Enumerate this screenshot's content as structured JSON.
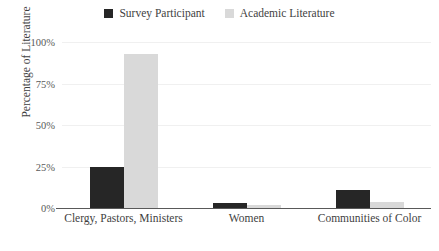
{
  "chart_data": {
    "type": "bar",
    "title": "",
    "subtitle": "",
    "xlabel": "",
    "ylabel": "Percentage of Literature",
    "ylim": [
      0,
      100
    ],
    "ytick_labels": [
      "0%",
      "25%",
      "50%",
      "75%",
      "100%"
    ],
    "ytick_values": [
      0,
      25,
      50,
      75,
      100
    ],
    "grid": "horizontal",
    "legend_position": "top-center",
    "categories": [
      "Clergy, Pastors, Ministers",
      "Women",
      "Communities of Color"
    ],
    "series": [
      {
        "name": "Survey Participant",
        "color": "#262626",
        "values": [
          25,
          3,
          11
        ]
      },
      {
        "name": "Academic Literature",
        "color": "#d9d9d9",
        "values": [
          93,
          2,
          3.5
        ]
      }
    ]
  }
}
